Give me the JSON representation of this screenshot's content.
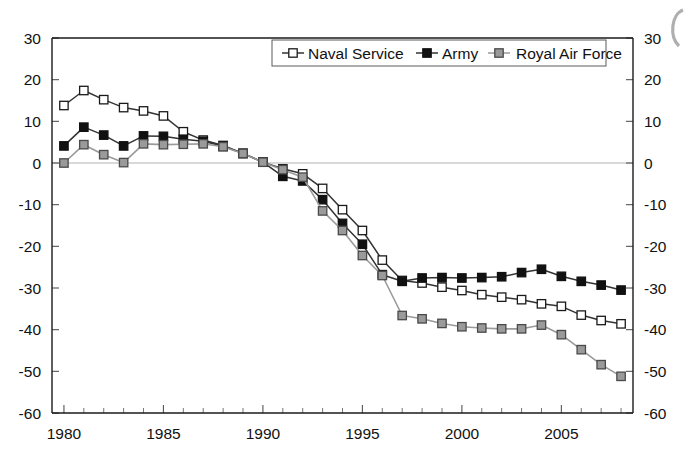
{
  "chart_data": {
    "type": "line",
    "title": "",
    "subtitle": "",
    "xlabel": "",
    "ylabel": "",
    "xlim": [
      1979.4,
      2008.6
    ],
    "ylim": [
      -60,
      30
    ],
    "grid": false,
    "legend_position": "top-center",
    "dual_y_axis": true,
    "x_tick_step_major": 5,
    "x_tick_step_minor": 1,
    "y_tick_step": 10,
    "x": [
      1980,
      1981,
      1982,
      1983,
      1984,
      1985,
      1986,
      1987,
      1988,
      1989,
      1990,
      1991,
      1992,
      1993,
      1994,
      1995,
      1996,
      1997,
      1998,
      1999,
      2000,
      2001,
      2002,
      2003,
      2004,
      2005,
      2006,
      2007,
      2008
    ],
    "xticklabels": [
      "1980",
      "1985",
      "1990",
      "1995",
      "2000",
      "2005"
    ],
    "xticks": [
      1980,
      1985,
      1990,
      1995,
      2000,
      2005
    ],
    "yticklabels": [
      "30",
      "20",
      "10",
      "0",
      "-10",
      "-20",
      "-30",
      "-40",
      "-50",
      "-60"
    ],
    "yticks": [
      30,
      20,
      10,
      0,
      -10,
      -20,
      -30,
      -40,
      -50,
      -60
    ],
    "yticklabels_right": [
      "30",
      "20",
      "10",
      "0",
      "-10",
      "-20",
      "-30",
      "-40",
      "-50",
      "-60"
    ],
    "series": [
      {
        "name": "Naval Service",
        "marker": "open-square",
        "marker_fill": "#ffffff",
        "marker_edge": "#1a1a1a",
        "line_color": "#333333",
        "values": [
          13.8,
          17.4,
          15.2,
          13.3,
          12.5,
          11.3,
          7.5,
          5.5,
          4.2,
          2.3,
          0.2,
          -1.4,
          -2.6,
          -6.1,
          -11.2,
          -16.2,
          -23.3,
          -28.2,
          -28.8,
          -29.8,
          -30.6,
          -31.6,
          -32.2,
          -32.8,
          -33.8,
          -34.4,
          -36.5,
          -37.8,
          -38.6
        ]
      },
      {
        "name": "Army",
        "marker": "filled-square",
        "marker_fill": "#111111",
        "marker_edge": "#111111",
        "line_color": "#333333",
        "values": [
          4.1,
          8.6,
          6.7,
          4.1,
          6.5,
          6.4,
          5.7,
          5.2,
          4.0,
          2.3,
          0.2,
          -3.2,
          -4.3,
          -8.8,
          -14.5,
          -19.5,
          -26.8,
          -28.4,
          -27.6,
          -27.5,
          -27.6,
          -27.5,
          -27.3,
          -26.3,
          -25.5,
          -27.2,
          -28.4,
          -29.3,
          -30.5
        ]
      },
      {
        "name": "Royal Air Force",
        "marker": "grey-square",
        "marker_fill": "#9a9a9a",
        "marker_edge": "#4a4a4a",
        "line_color": "#9a9a9a",
        "values": [
          0.0,
          4.4,
          2.0,
          0.1,
          4.6,
          4.4,
          4.5,
          4.6,
          3.9,
          2.3,
          0.2,
          -1.6,
          -3.4,
          -11.5,
          -16.2,
          -22.2,
          -27.0,
          -36.6,
          -37.4,
          -38.5,
          -39.3,
          -39.6,
          -39.8,
          -39.8,
          -38.9,
          -41.2,
          -44.8,
          -48.4,
          -51.2
        ]
      }
    ],
    "legend_entries": [
      "Naval Service",
      "Army",
      "Royal Air Force"
    ]
  },
  "colors": {
    "axis": "#1a1a1a",
    "zero_line": "#b4b4b4",
    "naval": "#333333",
    "army": "#111111",
    "raf": "#9a9a9a",
    "background": "#ffffff"
  }
}
